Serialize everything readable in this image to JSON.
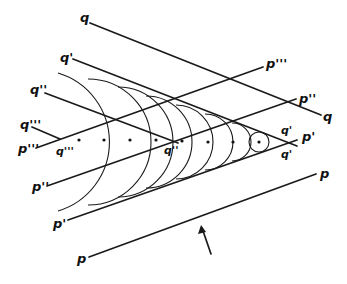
{
  "figure": {
    "colors": {
      "ink": "#1a1a1a",
      "background": "#ffffff"
    },
    "labels": {
      "q_top": "q",
      "q_right": "q",
      "q1_left": "q'",
      "q2_left": "q''",
      "q3_left": "q'''",
      "q3_mid": "q'''",
      "q2_mid": "q''",
      "q1_vertex_upper": "q'",
      "q1_vertex_lower": "q'",
      "p1_vertex": "p'",
      "p3_left": "p'''",
      "p3_right": "p'''",
      "p2_left": "p''",
      "p2_right": "p''",
      "p1_left": "p'",
      "p_left": "p",
      "p_right": "p"
    },
    "arrow": {
      "direction": "up-left",
      "meaning": "wave propagation direction"
    },
    "wavelet_centers_x": [
      79,
      104,
      130,
      156,
      182,
      208,
      233,
      259
    ],
    "wavelet_centers_y": 142,
    "vertex": [
      290,
      143
    ]
  }
}
